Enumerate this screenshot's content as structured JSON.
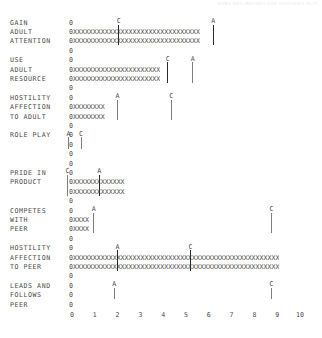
{
  "header": {
    "watermark": "WEBS AND MOTORS FOR TEACHERS (R,P)"
  },
  "chart_data": {
    "type": "bar",
    "title": "",
    "xlabel": "",
    "ylabel": "",
    "xlim": [
      0,
      10
    ],
    "grid": false,
    "legend": "none",
    "axis_ticks": [
      "0",
      "1",
      "2",
      "3",
      "4",
      "5",
      "6",
      "7",
      "8",
      "9",
      "10"
    ],
    "zero_char": "0",
    "bar_char": "X",
    "marker_labels": [
      "A",
      "C"
    ],
    "categories": [
      {
        "label_lines": [
          "GAIN",
          "ADULT",
          "ATTENTION"
        ],
        "bar_value": 6.2,
        "bar_rows": 2,
        "markers": [
          {
            "name": "C",
            "value": 2.05
          },
          {
            "name": "A",
            "value": 6.2
          }
        ]
      },
      {
        "label_lines": [
          "USE",
          "ADULT",
          "RESOURCE"
        ],
        "bar_value": 4.2,
        "bar_rows": 2,
        "markers": [
          {
            "name": "C",
            "value": 4.2
          },
          {
            "name": "A",
            "value": 5.3
          }
        ]
      },
      {
        "label_lines": [
          "HOSTILITY",
          "AFFECTION",
          "TO ADULT"
        ],
        "bar_value": 1.55,
        "bar_rows": 2,
        "markers": [
          {
            "name": "A",
            "value": 2.0
          },
          {
            "name": "C",
            "value": 4.35
          }
        ]
      },
      {
        "label_lines": [
          "ROLE PLAY"
        ],
        "bar_value": 0.0,
        "bar_rows": 0,
        "markers": [
          {
            "name": "A",
            "value": -0.15
          },
          {
            "name": "C",
            "value": 0.4
          }
        ]
      },
      {
        "label_lines": [
          "PRIDE IN",
          "PRODUCT"
        ],
        "bar_value": 2.45,
        "bar_rows": 2,
        "markers": [
          {
            "name": "C",
            "value": -0.2
          },
          {
            "name": "A",
            "value": 1.2
          }
        ]
      },
      {
        "label_lines": [
          "COMPETES",
          "WITH",
          "PEER"
        ],
        "bar_value": 0.8,
        "bar_rows": 2,
        "markers": [
          {
            "name": "A",
            "value": 0.95
          },
          {
            "name": "C",
            "value": 8.75
          }
        ]
      },
      {
        "label_lines": [
          "HOSTILITY",
          "AFFECTION",
          "TO PEER"
        ],
        "bar_value": 10.0,
        "bar_rows": 2,
        "markers": [
          {
            "name": "A",
            "value": 2.0
          },
          {
            "name": "C",
            "value": 5.2
          }
        ]
      },
      {
        "label_lines": [
          "LEADS AND",
          "FOLLOWS",
          "PEER"
        ],
        "bar_value": 0.0,
        "bar_rows": 0,
        "markers": [
          {
            "name": "A",
            "value": 1.85
          },
          {
            "name": "C",
            "value": 8.75
          }
        ]
      }
    ]
  }
}
